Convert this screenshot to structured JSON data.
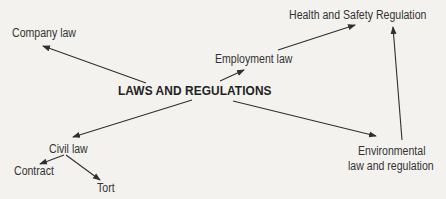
{
  "diagram": {
    "type": "mind-map",
    "center": {
      "label": "LAWS AND REGULATIONS"
    },
    "nodes": {
      "company_law": "Company law",
      "employment_law": "Employment law",
      "health_safety": "Health and Safety Regulation",
      "civil_law": "Civil law",
      "contract": "Contract",
      "tort": "Tort",
      "environmental_line1": "Environmental",
      "environmental_line2": "law and regulation"
    },
    "edges": [
      {
        "from": "LAWS AND REGULATIONS",
        "to": "Company law"
      },
      {
        "from": "LAWS AND REGULATIONS",
        "to": "Employment law"
      },
      {
        "from": "Employment law",
        "to": "Health and Safety Regulation"
      },
      {
        "from": "LAWS AND REGULATIONS",
        "to": "Civil law"
      },
      {
        "from": "Civil law",
        "to": "Contract"
      },
      {
        "from": "Civil law",
        "to": "Tort"
      },
      {
        "from": "LAWS AND REGULATIONS",
        "to": "Environmental law and regulation"
      },
      {
        "from": "Environmental law and regulation",
        "to": "Health and Safety Regulation"
      }
    ],
    "colors": {
      "background": "#f3f2ef",
      "line": "#2f2f2f",
      "text": "#333333"
    }
  }
}
